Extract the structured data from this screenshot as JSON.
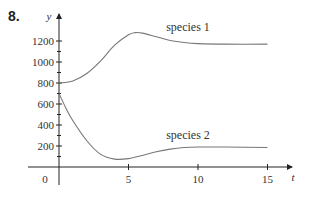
{
  "problem": {
    "number": "8."
  },
  "chart_data": {
    "type": "line",
    "title": "",
    "xlabel": "t",
    "ylabel": "y",
    "xlim": [
      0,
      16
    ],
    "ylim": [
      0,
      1300
    ],
    "x_ticks": [
      5,
      10,
      15
    ],
    "x_tick_labels": [
      "5",
      "10",
      "15"
    ],
    "y_ticks": [
      200,
      400,
      600,
      800,
      1000,
      1200
    ],
    "y_tick_labels": [
      "200",
      "400",
      "600",
      "800",
      "1000",
      "1200"
    ],
    "y_minor_ticks": [
      100,
      300,
      500,
      700,
      900,
      1100
    ],
    "origin_label": "0",
    "grid": false,
    "legend": "inline annotations",
    "series": [
      {
        "name": "species 1",
        "x": [
          0,
          1,
          2,
          3,
          4,
          5,
          5.5,
          6,
          7,
          8,
          9,
          10,
          12,
          15
        ],
        "values": [
          800,
          820,
          890,
          1010,
          1160,
          1260,
          1280,
          1275,
          1240,
          1205,
          1185,
          1175,
          1170,
          1170
        ]
      },
      {
        "name": "species 2",
        "x": [
          0,
          0.5,
          1,
          2,
          3,
          4,
          5,
          6,
          7,
          8,
          9,
          10,
          12,
          15
        ],
        "values": [
          700,
          560,
          440,
          250,
          120,
          75,
          80,
          110,
          145,
          170,
          185,
          190,
          190,
          185
        ]
      }
    ]
  }
}
